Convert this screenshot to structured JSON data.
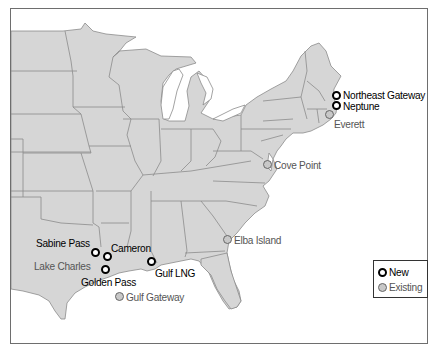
{
  "map": {
    "title": "",
    "region": "Eastern United States"
  },
  "terminals": {
    "new": [
      {
        "name": "Northeast Gateway",
        "x": 336,
        "y": 96
      },
      {
        "name": "Neptune",
        "x": 336,
        "y": 106
      },
      {
        "name": "Sabine Pass",
        "x": 96,
        "y": 253
      },
      {
        "name": "Cameron",
        "x": 108,
        "y": 257
      },
      {
        "name": "Golden Pass",
        "x": 105,
        "y": 269
      },
      {
        "name": "Gulf LNG",
        "x": 151,
        "y": 262
      }
    ],
    "existing": [
      {
        "name": "Everett",
        "x": 329,
        "y": 115
      },
      {
        "name": "Cove Point",
        "x": 267,
        "y": 164
      },
      {
        "name": "Elba Island",
        "x": 228,
        "y": 240
      },
      {
        "name": "Lake Charles",
        "x": 96,
        "y": 265
      },
      {
        "name": "Gulf Gateway",
        "x": 119,
        "y": 297
      }
    ]
  },
  "labels": {
    "northeast_gateway": "Northeast Gateway",
    "neptune": "Neptune",
    "everett": "Everett",
    "cove_point": "Cove Point",
    "elba_island": "Elba Island",
    "sabine_pass": "Sabine Pass",
    "cameron": "Cameron",
    "lake_charles": "Lake Charles",
    "golden_pass": "Golden Pass",
    "gulf_lng": "Gulf LNG",
    "gulf_gateway": "Gulf Gateway"
  },
  "legend": {
    "new_label": "New",
    "existing_label": "Existing"
  },
  "colors": {
    "land": "#d6d6d6",
    "state_border": "#8c8c8c",
    "water": "#ffffff",
    "new_marker": "#000000",
    "existing_marker_fill": "#c8c8c8",
    "existing_text": "#555555"
  }
}
